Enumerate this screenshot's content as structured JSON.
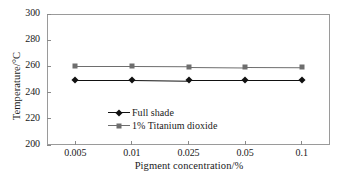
{
  "chart_data": {
    "type": "line",
    "title": "",
    "xlabel": "Pigment concentration/%",
    "ylabel": "Temperature/°C",
    "categories": [
      "0.005",
      "0.01",
      "0.025",
      "0.05",
      "0.1"
    ],
    "xtick_labels": [
      "0.005",
      "0.01",
      "0.025",
      "0.05",
      "0.1"
    ],
    "ytick_labels": [
      "300",
      "280",
      "260",
      "240",
      "220",
      "200"
    ],
    "ylim": [
      200,
      300
    ],
    "ytick_values": [
      300,
      280,
      260,
      240,
      220,
      200
    ],
    "grid": false,
    "legend_position": "center-left-inside",
    "series": [
      {
        "name": "Full shade",
        "marker": "diamond",
        "color": "#111111",
        "values": [
          250,
          250,
          249.5,
          249.5,
          249.5
        ]
      },
      {
        "name": "1% Titanium dioxide",
        "marker": "square",
        "color": "#6e6e6e",
        "values": [
          260,
          260,
          259.8,
          259.5,
          259.3
        ]
      }
    ]
  },
  "legend": {
    "items": [
      {
        "label": "Full shade"
      },
      {
        "label": "1% Titanium dioxide"
      }
    ]
  },
  "colors": {
    "axis": "#9a9a9a",
    "tick": "#8a8a8a",
    "series_full_shade": "#111111",
    "series_titanium_dioxide": "#6e6e6e",
    "background": "#ffffff",
    "text": "#1a1a1a"
  }
}
